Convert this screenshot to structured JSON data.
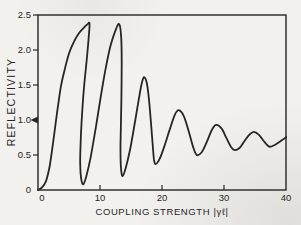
{
  "figure": {
    "background": "#f2f1ee",
    "ink": "#26251f"
  },
  "chart_data": {
    "type": "line",
    "title": "",
    "xlabel": "COUPLING STRENGTH |γℓ|",
    "ylabel": "REFLECTIVITY",
    "xlim": [
      0,
      40
    ],
    "ylim": [
      0,
      2.5
    ],
    "grid": false,
    "frame": "box",
    "legend": null,
    "x_ticks": {
      "values": [
        0,
        10,
        20,
        30,
        40
      ],
      "labels": [
        "0",
        "10",
        "20",
        "30",
        "40"
      ]
    },
    "y_ticks": {
      "values": [
        0,
        0.5,
        1.0,
        1.5,
        2.0,
        2.5
      ],
      "labels": [
        "0",
        "0.5",
        "1.0",
        "1.5",
        "2.0",
        "2.5"
      ]
    },
    "y_axis_marker": {
      "value": 1.0,
      "shape": "left-arrowhead"
    },
    "peaks": [
      [
        8.3,
        2.38
      ],
      [
        13.1,
        2.37
      ],
      [
        17.2,
        1.61
      ],
      [
        22.7,
        1.14
      ],
      [
        28.7,
        0.93
      ],
      [
        34.8,
        0.83
      ]
    ],
    "minima": [
      [
        7.3,
        0.08
      ],
      [
        13.65,
        0.2
      ],
      [
        18.95,
        0.37
      ],
      [
        25.6,
        0.5
      ],
      [
        31.7,
        0.57
      ],
      [
        37.3,
        0.62
      ]
    ],
    "series": [
      {
        "name": "reflectivity-curve",
        "points": [
          [
            0,
            0
          ],
          [
            0.7,
            0.04
          ],
          [
            1.3,
            0.13
          ],
          [
            1.9,
            0.35
          ],
          [
            2.5,
            0.72
          ],
          [
            3.1,
            1.12
          ],
          [
            3.7,
            1.48
          ],
          [
            4.3,
            1.72
          ],
          [
            5.0,
            1.95
          ],
          [
            5.8,
            2.12
          ],
          [
            6.6,
            2.24
          ],
          [
            7.4,
            2.32
          ],
          [
            8.0,
            2.37
          ],
          [
            8.3,
            2.38
          ],
          [
            8.2,
            2.2
          ],
          [
            7.9,
            1.9
          ],
          [
            7.4,
            1.45
          ],
          [
            7.05,
            1.0
          ],
          [
            6.85,
            0.62
          ],
          [
            6.8,
            0.38
          ],
          [
            6.95,
            0.17
          ],
          [
            7.3,
            0.08
          ],
          [
            7.8,
            0.2
          ],
          [
            8.5,
            0.47
          ],
          [
            9.3,
            0.88
          ],
          [
            10.1,
            1.32
          ],
          [
            10.9,
            1.73
          ],
          [
            11.7,
            2.06
          ],
          [
            12.5,
            2.28
          ],
          [
            13.1,
            2.37
          ],
          [
            13.42,
            2.18
          ],
          [
            13.5,
            1.8
          ],
          [
            13.45,
            1.3
          ],
          [
            13.35,
            0.85
          ],
          [
            13.3,
            0.55
          ],
          [
            13.4,
            0.3
          ],
          [
            13.65,
            0.2
          ],
          [
            14.2,
            0.33
          ],
          [
            14.9,
            0.6
          ],
          [
            15.6,
            0.95
          ],
          [
            16.3,
            1.32
          ],
          [
            16.8,
            1.55
          ],
          [
            17.2,
            1.61
          ],
          [
            17.65,
            1.48
          ],
          [
            18.05,
            1.15
          ],
          [
            18.45,
            0.7
          ],
          [
            18.7,
            0.44
          ],
          [
            18.95,
            0.37
          ],
          [
            19.6,
            0.44
          ],
          [
            20.4,
            0.63
          ],
          [
            21.3,
            0.88
          ],
          [
            22.1,
            1.08
          ],
          [
            22.7,
            1.14
          ],
          [
            23.5,
            1.06
          ],
          [
            24.3,
            0.84
          ],
          [
            25.0,
            0.62
          ],
          [
            25.6,
            0.5
          ],
          [
            26.4,
            0.54
          ],
          [
            27.2,
            0.68
          ],
          [
            28.0,
            0.85
          ],
          [
            28.7,
            0.93
          ],
          [
            29.6,
            0.88
          ],
          [
            30.4,
            0.74
          ],
          [
            31.1,
            0.62
          ],
          [
            31.7,
            0.57
          ],
          [
            32.5,
            0.6
          ],
          [
            33.3,
            0.7
          ],
          [
            34.1,
            0.79
          ],
          [
            34.8,
            0.83
          ],
          [
            35.6,
            0.79
          ],
          [
            36.4,
            0.7
          ],
          [
            37.3,
            0.62
          ],
          [
            38.1,
            0.64
          ],
          [
            39.0,
            0.69
          ],
          [
            39.8,
            0.74
          ],
          [
            40.4,
            0.77
          ]
        ]
      }
    ]
  }
}
